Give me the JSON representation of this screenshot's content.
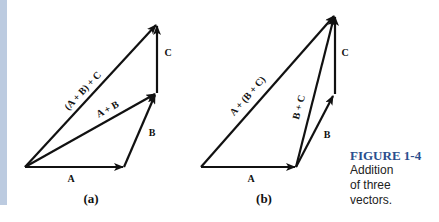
{
  "figure": {
    "number": "FIGURE 1-4",
    "caption_lines": [
      "Addition",
      "of three",
      "vectors."
    ],
    "accent_color": "#2b4f8e",
    "sidebar_color": "#bccbe0"
  },
  "panel_a": {
    "sublabel": "(a)",
    "labels": {
      "A": "A",
      "B": "B",
      "C": "C",
      "A_plus_B": "A + B",
      "AB_plus_C": "(A + B) + C"
    }
  },
  "panel_b": {
    "sublabel": "(b)",
    "labels": {
      "A": "A",
      "B": "B",
      "C": "C",
      "B_plus_C": "B + C",
      "A_plus_BC": "A + (B + C)"
    }
  }
}
